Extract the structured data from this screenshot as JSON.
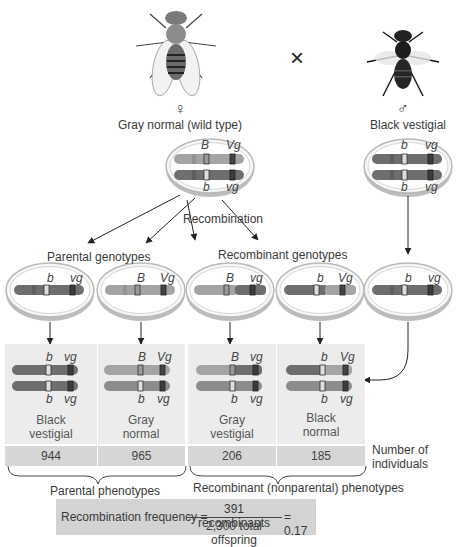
{
  "parents": {
    "cross_symbol": "×",
    "female": {
      "symbol": "♀",
      "label": "Gray normal (wild type)",
      "top": {
        "g1": "B",
        "g2": "Vg"
      },
      "bottom": {
        "g1": "b",
        "g2": "vg"
      }
    },
    "male": {
      "symbol": "♂",
      "label": "Black vestigial",
      "top": {
        "g1": "b",
        "g2": "vg"
      },
      "bottom": {
        "g1": "b",
        "g2": "vg"
      }
    }
  },
  "labels": {
    "recombination": "Recombination",
    "parental_genotypes": "Parental genotypes",
    "recombinant_genotypes": "Recombinant genotypes",
    "number_of_individuals_1": "Number of",
    "number_of_individuals_2": "individuals",
    "parental_phenotypes": "Parental phenotypes",
    "recombinant_phenotypes": "Recombinant (nonparental) phenotypes"
  },
  "gametes": [
    {
      "g1": "b",
      "g2": "vg"
    },
    {
      "g1": "B",
      "g2": "Vg"
    },
    {
      "g1": "B",
      "g2": "vg"
    },
    {
      "g1": "b",
      "g2": "Vg"
    },
    {
      "g1": "b",
      "g2": "vg"
    }
  ],
  "offspring": [
    {
      "top": {
        "g1": "b",
        "g2": "vg"
      },
      "bottom": {
        "g1": "b",
        "g2": "vg"
      },
      "phenotype_1": "Black",
      "phenotype_2": "vestigial",
      "count": "944"
    },
    {
      "top": {
        "g1": "B",
        "g2": "Vg"
      },
      "bottom": {
        "g1": "b",
        "g2": "vg"
      },
      "phenotype_1": "Gray",
      "phenotype_2": "normal",
      "count": "965"
    },
    {
      "top": {
        "g1": "B",
        "g2": "vg"
      },
      "bottom": {
        "g1": "b",
        "g2": "vg"
      },
      "phenotype_1": "Gray",
      "phenotype_2": "vestigial",
      "count": "206"
    },
    {
      "top": {
        "g1": "b",
        "g2": "Vg"
      },
      "bottom": {
        "g1": "b",
        "g2": "vg"
      },
      "phenotype_1": "Black",
      "phenotype_2": "normal",
      "count": "185"
    }
  ],
  "formula": {
    "lhs": "Recombination frequency =",
    "numerator": "391 recombinants",
    "denominator": "2,300 total offspring",
    "result": "= 0.17"
  },
  "colors": {
    "gray_chromosome": "#a4a4a4",
    "black_chromosome": "#6e6e6e",
    "panel_bg": "#ececec",
    "count_bg": "#d6d6d6",
    "formula_bg": "#d3d3d3"
  }
}
